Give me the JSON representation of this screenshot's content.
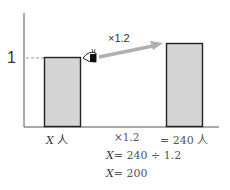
{
  "diagram": {
    "y_tick_label": "1",
    "arrow_label": "×1.2",
    "bars": [
      {
        "id": "left",
        "label": "X 人",
        "relative_height": 1
      },
      {
        "id": "right",
        "label": "= 240 人",
        "relative_height": 1.2
      }
    ],
    "middle_label": "×1.2",
    "equations": [
      {
        "var": "X",
        "rest": "= 240 ÷ 1.2"
      },
      {
        "var": "X",
        "rest": "= 200"
      }
    ],
    "icons": [
      "eye-icon",
      "arrow-icon"
    ],
    "colors": {
      "bar_fill": "#d4d4d4",
      "bar_stroke": "#222222",
      "axis": "#555555",
      "arrow": "#b0b0b0",
      "dash": "#999999"
    }
  },
  "labels": {
    "left_var": "X",
    "left_unit": "人",
    "right": "= 240 人"
  }
}
